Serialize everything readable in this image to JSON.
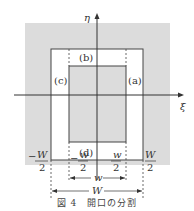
{
  "figure": {
    "caption": "図 4　開口の分割",
    "colors": {
      "shade": "#dcdcdc",
      "line": "#444444",
      "background": "#ffffff"
    }
  },
  "axes": {
    "x_label": "ξ",
    "y_label": "η"
  },
  "regions": {
    "a": "(a)",
    "b": "(b)",
    "c": "(c)",
    "d": "(d)"
  },
  "ticks": {
    "neg_W_half_num": "W",
    "neg_W_half_den": "2",
    "neg_W_sign": "−",
    "neg_w_half_num": "w",
    "neg_w_half_den": "2",
    "neg_w_sign": "−",
    "pos_w_half_num": "w",
    "pos_w_half_den": "2",
    "pos_W_half_num": "W",
    "pos_W_half_den": "2"
  },
  "dimensions": {
    "inner_width": "w",
    "outer_width": "W"
  }
}
